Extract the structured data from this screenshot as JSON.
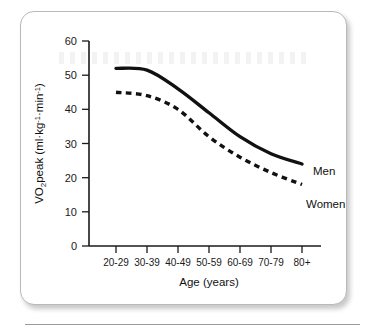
{
  "chart_data": {
    "type": "line",
    "title": "",
    "xlabel": "Age (years)",
    "ylabel": "VO2peak (ml·kg⁻¹·min⁻¹)",
    "ylabel_parts": {
      "pre": "VO",
      "sub": "2",
      "post": "peak (ml·kg",
      "sup1": "-1",
      "mid": "·min",
      "sup2": "-1",
      "end": ")"
    },
    "categories": [
      "20-29",
      "30-39",
      "40-49",
      "50-59",
      "60-69",
      "70-79",
      "80+"
    ],
    "yticks": [
      0,
      10,
      20,
      30,
      40,
      50,
      60
    ],
    "ylim": [
      0,
      60
    ],
    "grid": false,
    "legend_position": "inline-right",
    "series": [
      {
        "name": "Men",
        "style": "solid",
        "values": [
          52,
          51.5,
          46,
          39,
          32,
          27,
          24
        ]
      },
      {
        "name": "Women",
        "style": "dashed",
        "values": [
          45,
          44,
          40,
          32,
          26,
          21.5,
          18
        ]
      }
    ]
  }
}
